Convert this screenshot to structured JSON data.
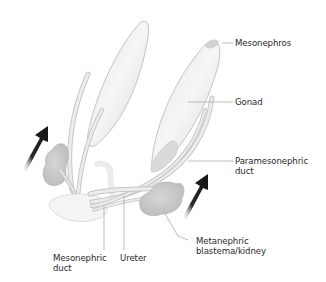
{
  "diagram": {
    "type": "anatomical illustration",
    "colors": {
      "structure_fill": "#d8d8d8",
      "structure_light": "#eeeeee",
      "structure_stroke": "#b9b9b9",
      "kidney_fill": "#c9c9c9",
      "arrow_dark": "#1f1f1f",
      "leader_line": "#9a9a9a",
      "label_text": "#2b2b2b"
    },
    "labels": {
      "mesonephros": "Mesonephros",
      "gonad": "Gonad",
      "paramesonephric_duct": "Paramesonephric\nduct",
      "metanephric_blastema": "Metanephric\nblastema/kidney",
      "ureter": "Ureter",
      "mesonephric_duct": "Mesonephric\nduct"
    },
    "arrows": [
      {
        "name": "left-ascent-arrow",
        "direction": "up-right"
      },
      {
        "name": "right-ascent-arrow",
        "direction": "up-right"
      }
    ]
  }
}
